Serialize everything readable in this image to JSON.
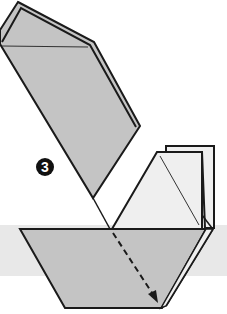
{
  "diagram": {
    "type": "origami-instruction",
    "step": {
      "number": "3",
      "label": "3"
    },
    "colors": {
      "paper_gray": "#c4c4c4",
      "paper_white": "#efefef",
      "band": "#e8e8e8",
      "outline": "#1a1a1a",
      "background": "#ffffff"
    },
    "elements": [
      {
        "name": "upper-flap",
        "description": "Gray folded flap rotated up-left"
      },
      {
        "name": "white-triangle-flap",
        "description": "Light trapezoid flap with diagonal crease"
      },
      {
        "name": "back-layer",
        "description": "Layer behind the white flap"
      },
      {
        "name": "boat-base",
        "description": "Gray trapezoid base"
      },
      {
        "name": "fold-arrow",
        "description": "Dashed arrow pointing down-right indicating fold"
      },
      {
        "name": "background-band",
        "description": "Light gray horizontal band"
      }
    ]
  }
}
